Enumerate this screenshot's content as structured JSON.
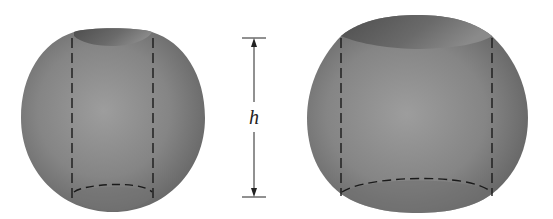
{
  "figure": {
    "height_label": "h",
    "colors": {
      "background": "#ffffff",
      "sphere_light": "#9a9a9a",
      "sphere_mid": "#7d7d7d",
      "sphere_dark": "#5e5e5e",
      "hole_shadow": "#555555",
      "dash_line": "#1a1a1a",
      "dimension_line": "#222222"
    },
    "left_solid": {
      "label": "smaller sphere with hole"
    },
    "right_solid": {
      "label": "larger sphere with hole"
    }
  }
}
